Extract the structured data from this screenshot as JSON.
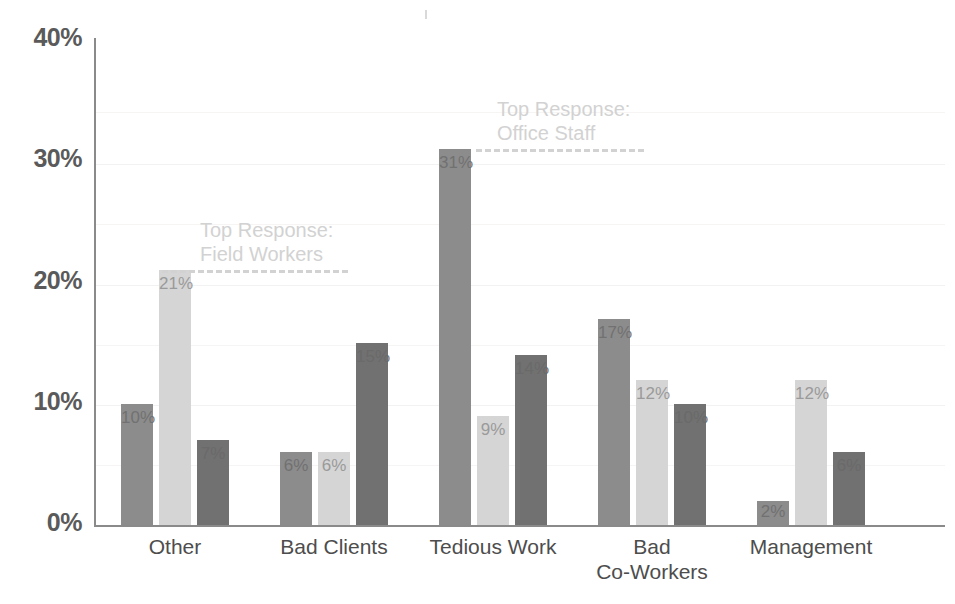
{
  "chart_data": {
    "type": "bar",
    "title": "",
    "subtitle": "",
    "xlabel": "",
    "ylabel": "",
    "ylim": [
      0,
      40
    ],
    "grid": true,
    "legend_position": "none",
    "y_unit": "%",
    "categories": [
      "Other",
      "Bad Clients",
      "Tedious Work",
      "Bad\nCo-Workers",
      "Management"
    ],
    "y_ticks": [
      {
        "value": 0,
        "label": "0%"
      },
      {
        "value": 10,
        "label": "10%"
      },
      {
        "value": 20,
        "label": "20%"
      },
      {
        "value": 30,
        "label": "30%"
      },
      {
        "value": 40,
        "label": "40%"
      }
    ],
    "series": [
      {
        "name": "series-1",
        "color": "#8c8c8c",
        "values": [
          10,
          6,
          31,
          17,
          2
        ],
        "labels": [
          "10%",
          "6%",
          "31%",
          "17%",
          "2%"
        ]
      },
      {
        "name": "series-2",
        "color": "#d5d5d5",
        "values": [
          21,
          6,
          9,
          12,
          12
        ],
        "labels": [
          "21%",
          "6%",
          "9%",
          "12%",
          "12%"
        ]
      },
      {
        "name": "series-3",
        "color": "#717171",
        "values": [
          7,
          15,
          14,
          10,
          6
        ],
        "labels": [
          "7%",
          "15%",
          "14%",
          "10%",
          "6%"
        ]
      }
    ],
    "annotations": [
      {
        "id": "field-workers",
        "text": "Top Response:\nField Workers",
        "value": 21,
        "color": "#d2d2d2"
      },
      {
        "id": "office-staff",
        "text": "Top Response:\nOffice Staff",
        "value": 31,
        "color": "#d2d2d2"
      }
    ]
  }
}
